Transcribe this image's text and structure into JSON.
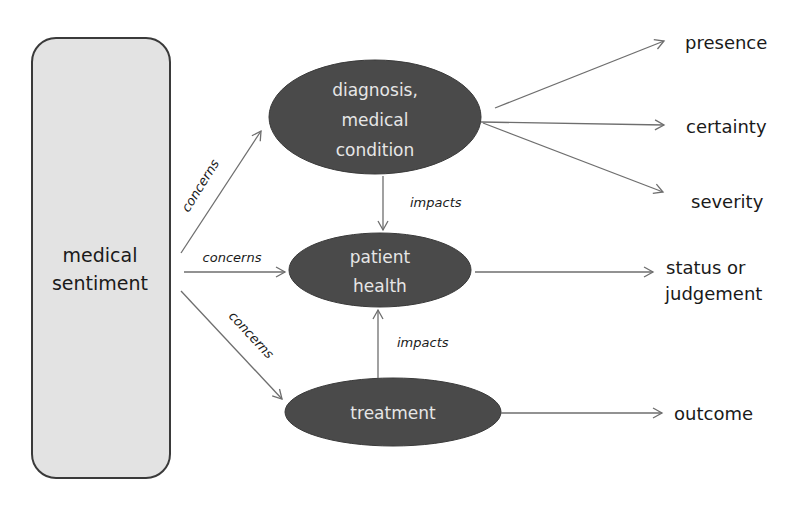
{
  "diagram": {
    "root": {
      "label_line1": "medical",
      "label_line2": "sentiment"
    },
    "nodes": {
      "diagnosis": {
        "line1": "diagnosis,",
        "line2": "medical",
        "line3": "condition"
      },
      "patient_health": {
        "line1": "patient",
        "line2": "health"
      },
      "treatment": {
        "line1": "treatment"
      }
    },
    "edges": {
      "concerns_diagnosis": "concerns",
      "concerns_health": "concerns",
      "concerns_treatment": "concerns",
      "impacts_diagnosis_health": "impacts",
      "impacts_treatment_health": "impacts"
    },
    "outputs": {
      "presence": "presence",
      "certainty": "certainty",
      "severity": "severity",
      "status_line1": "status or",
      "status_line2": "judgement",
      "outcome": "outcome"
    },
    "colors": {
      "node_fill": "#4a4a4a",
      "node_text": "#e6e6e6",
      "root_fill": "#e3e3e3",
      "root_border": "#3a3a3a",
      "arrow": "#6e6e6e",
      "text": "#1a1a1a"
    }
  }
}
